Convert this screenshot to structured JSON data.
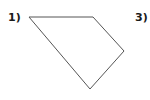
{
  "labels": {
    "first": "1)",
    "second": "3)"
  },
  "shape": {
    "type": "quadrilateral",
    "stroke": "#555555",
    "fill": "none",
    "points": [
      [
        29,
        17
      ],
      [
        93,
        17
      ],
      [
        124,
        51
      ],
      [
        90,
        89
      ]
    ]
  }
}
